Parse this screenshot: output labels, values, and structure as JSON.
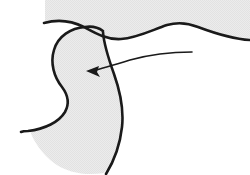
{
  "figure": {
    "background_color": "#ffffff",
    "ink_color": "#1a1a1a",
    "fill_color": "#e9e9e9",
    "fill_texture": "halftone-dither",
    "canvas": {
      "width": 250,
      "height": 175
    }
  },
  "shapes": {
    "upper_band": {
      "name": "shaded-upper-band",
      "description": "Light gray region along the top edge bounded below by a wavy contour line",
      "fill": "#e9e9e9",
      "path": "M 45 0 L 250 0 L 250 38 C 232 38 214 33 198 27 C 188 23 178 22 168 25 C 152 30 138 38 122 39 C 108 40 96 34 86 28 C 74 21 60 20 45 23 Z"
    },
    "main_form": {
      "name": "shaded-main-form",
      "description": "Bulbous shaded body with rounded head, narrow neck and flared lower base",
      "fill": "#e9e9e9",
      "path": "M 86 28 C 72 28 59 36 55 50 C 51 63 55 76 63 86 C 69 94 71 103 66 112 C 60 122 46 129 30 131 C 34 142 42 154 54 163 C 68 173 86 176 104 173 C 114 159 120 142 122 124 C 124 106 121 88 114 72 C 108 58 104 44 103 32 C 100 29 93 28 86 28 Z"
    },
    "wavy_contour": {
      "name": "wavy-contour-line",
      "description": "Long sinuous line crossing the upper portion of the figure",
      "stroke": "#1a1a1a",
      "width": 2.6,
      "path": "M 44 23 C 58 19 72 21 84 27 C 95 33 107 40 121 39 C 137 38 152 30 167 25 C 178 22 188 23 198 27 C 214 33 232 39 250 40"
    },
    "form_outline": {
      "name": "main-form-outline",
      "description": "Dark contour tracing the left, lower and right sides of the shaded body",
      "stroke": "#1a1a1a",
      "width": 2.6,
      "path": "M 103 31 C 99 28 92 26 85 27 C 71 28 58 36 54 50 C 50 63 54 77 62 87 C 68 95 70 103 65 112 C 59 122 45 129 28 131 C 25 131 23 131 21 132"
    },
    "right_edge": {
      "name": "main-form-right-edge",
      "description": "Long dark edge running down the right side of the shaded body",
      "stroke": "#1a1a1a",
      "width": 2.6,
      "path": "M 103 32 C 104 46 109 60 114 74 C 120 91 124 109 122 127 C 120 145 114 161 106 174"
    },
    "arrow": {
      "name": "pointer-arrow",
      "description": "Thin leader arrow sweeping from the right and pointing down-left at the neck of the form",
      "stroke": "#1a1a1a",
      "width": 1.6,
      "tail_point": {
        "x": 192,
        "y": 52
      },
      "tip_point": {
        "x": 87,
        "y": 71
      },
      "shaft_path": "M 192 52 C 170 52 148 55 130 60 C 117 64 104 68 92 71",
      "head_path": "M 86 71 L 99 66 L 97 72 L 100 77 Z"
    }
  },
  "labels": {
    "alt_text": "Black and white line illustration: a gray shaded organic form with a rounded head and flared base sits below a wavy contour line, with a thin arrow indicating the narrow neck region."
  }
}
